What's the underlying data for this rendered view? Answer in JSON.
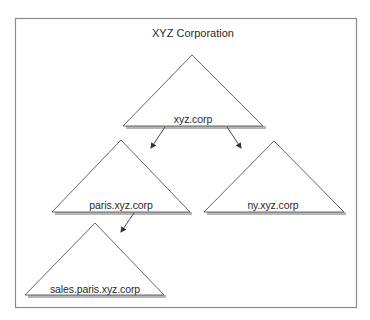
{
  "diagram": {
    "title": "XYZ Corporation",
    "type": "domain-tree",
    "nodes": [
      {
        "id": "root",
        "label": "xyz.corp",
        "parent": null
      },
      {
        "id": "paris",
        "label": "paris.xyz.corp",
        "parent": "root"
      },
      {
        "id": "ny",
        "label": "ny.xyz.corp",
        "parent": "root"
      },
      {
        "id": "sales",
        "label": "sales.paris.xyz.corp",
        "parent": "paris"
      }
    ],
    "edges": [
      {
        "from": "xyz.corp",
        "to": "paris.xyz.corp"
      },
      {
        "from": "xyz.corp",
        "to": "ny.xyz.corp"
      },
      {
        "from": "paris.xyz.corp",
        "to": "sales.paris.xyz.corp"
      }
    ]
  }
}
